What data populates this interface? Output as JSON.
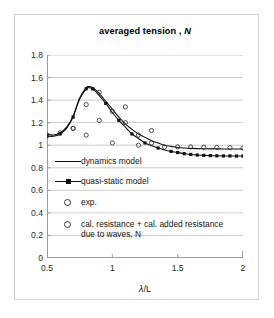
{
  "chart_data": {
    "type": "line",
    "title": "averaged tension , N",
    "title_plain": "averaged tension",
    "title_italic_part": "N",
    "xlabel": "λ/L",
    "ylabel": "",
    "xlim": [
      0.5,
      2.0
    ],
    "ylim": [
      0,
      1.8
    ],
    "xticks": [
      "0.5",
      "1",
      "1.5",
      "2"
    ],
    "xtick_values": [
      0.5,
      1,
      1.5,
      2
    ],
    "yticks": [
      "0",
      "0.2",
      "0.4",
      "0.6",
      "0.8",
      "1",
      "1.2",
      "1.4",
      "1.6",
      "1.8"
    ],
    "ytick_values": [
      0,
      0.2,
      0.4,
      0.6,
      0.8,
      1.0,
      1.2,
      1.4,
      1.6,
      1.8
    ],
    "grid": "horizontal",
    "legend_position": "inside-lower-left",
    "series": [
      {
        "name": "dynamics model",
        "style": "line",
        "marker": "none",
        "color": "#111111",
        "x": [
          0.5,
          0.55,
          0.6,
          0.65,
          0.7,
          0.75,
          0.8,
          0.82,
          0.85,
          0.9,
          0.95,
          1.0,
          1.05,
          1.1,
          1.15,
          1.2,
          1.25,
          1.3,
          1.35,
          1.4,
          1.45,
          1.5,
          1.55,
          1.6,
          1.65,
          1.7,
          1.75,
          1.8,
          1.85,
          1.9,
          1.95,
          2.0
        ],
        "y": [
          1.1,
          1.09,
          1.11,
          1.16,
          1.26,
          1.42,
          1.51,
          1.52,
          1.51,
          1.46,
          1.39,
          1.32,
          1.25,
          1.19,
          1.14,
          1.1,
          1.07,
          1.04,
          1.02,
          1.0,
          0.99,
          0.98,
          0.975,
          0.972,
          0.97,
          0.969,
          0.968,
          0.968,
          0.967,
          0.967,
          0.967,
          0.967
        ]
      },
      {
        "name": "quasi-static model",
        "style": "line-marker",
        "marker": "square",
        "color": "#111111",
        "x": [
          0.5,
          0.55,
          0.6,
          0.65,
          0.7,
          0.75,
          0.8,
          0.82,
          0.85,
          0.9,
          0.95,
          1.0,
          1.05,
          1.1,
          1.15,
          1.2,
          1.25,
          1.3,
          1.35,
          1.4,
          1.45,
          1.5,
          1.55,
          1.6,
          1.65,
          1.7,
          1.75,
          1.8,
          1.85,
          1.9,
          1.95,
          2.0
        ],
        "y": [
          1.08,
          1.08,
          1.1,
          1.15,
          1.25,
          1.41,
          1.5,
          1.51,
          1.5,
          1.44,
          1.37,
          1.29,
          1.22,
          1.16,
          1.1,
          1.06,
          1.02,
          0.995,
          0.975,
          0.958,
          0.945,
          0.935,
          0.925,
          0.918,
          0.913,
          0.91,
          0.908,
          0.906,
          0.905,
          0.905,
          0.904,
          0.904
        ]
      },
      {
        "name": "exp.",
        "style": "scatter",
        "marker": "open-circle",
        "color": "#333333",
        "x": [
          0.7,
          0.8,
          0.9,
          1.0,
          1.1,
          1.2,
          1.3
        ],
        "y": [
          1.15,
          1.09,
          1.22,
          1.02,
          1.34,
          1.0,
          1.13
        ]
      },
      {
        "name": "cal. resistance + cal. added resistance due to waves, N",
        "style": "scatter",
        "marker": "open-circle",
        "color": "#333333",
        "x": [
          0.5,
          0.6,
          0.7,
          0.8,
          0.9,
          1.0,
          1.1,
          1.2,
          1.3,
          1.4,
          1.5,
          1.6,
          1.7,
          1.8,
          1.9,
          2.0
        ],
        "y": [
          1.09,
          1.11,
          1.15,
          1.36,
          1.47,
          1.3,
          1.2,
          1.09,
          1.02,
          0.985,
          0.985,
          0.985,
          0.982,
          0.98,
          0.978,
          0.975
        ]
      }
    ]
  },
  "legend": {
    "items": [
      {
        "label": "dynamics model",
        "key": "line",
        "icon": "line-key-icon"
      },
      {
        "label": "quasi-static model",
        "key": "line-square",
        "icon": "line-square-key-icon"
      },
      {
        "label": "exp.",
        "key": "circle",
        "icon": "open-circle-key-icon"
      },
      {
        "label": "cal. resistance + cal. added resistance\ndue to waves, N",
        "key": "circle",
        "icon": "open-circle-key-icon"
      }
    ]
  },
  "axes": {
    "xlabel_prefix": "λ",
    "xlabel_suffix": "/L"
  },
  "colors": {
    "line": "#111111",
    "grid": "#bfbfbf",
    "axis": "#9a9a9a",
    "frame": "#d0d0d0",
    "text": "#1a1a1a",
    "background": "#ffffff"
  }
}
